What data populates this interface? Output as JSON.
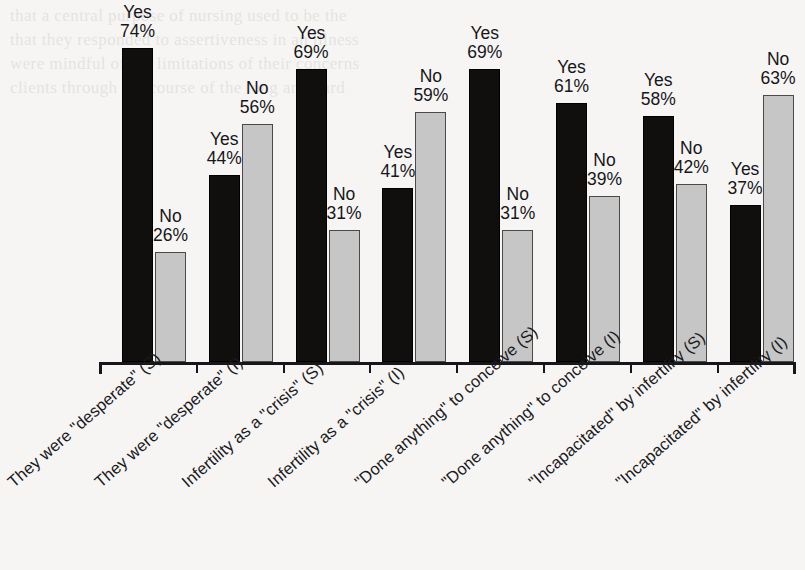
{
  "chart_data": {
    "type": "bar",
    "title": "",
    "subtitle": "",
    "xlabel": "",
    "ylabel": "",
    "ylim": [
      0,
      80
    ],
    "grid": false,
    "legend_position": "none",
    "value_suffix": "%",
    "categories": [
      "They were \"desperate\" (S)",
      "They were \"desperate\" (I)",
      "Infertility as a \"crisis\" (S)",
      "Infertility as a \"crisis\" (I)",
      "\"Done anything\" to conceive (S)",
      "\"Done anything\" to conceive (I)",
      "\"Incapacitated\" by infertility (S)",
      "\"Incapacitated\" by infertility (I)"
    ],
    "series": [
      {
        "name": "Yes",
        "color": "#100f0d",
        "values": [
          74,
          44,
          69,
          41,
          69,
          61,
          58,
          37
        ]
      },
      {
        "name": "No",
        "color": "#c6c6c6",
        "values": [
          26,
          56,
          31,
          59,
          31,
          39,
          42,
          63
        ]
      }
    ],
    "point_labels": [
      {
        "series": "Yes",
        "category_index": 0,
        "name": "Yes",
        "value": "74%"
      },
      {
        "series": "No",
        "category_index": 0,
        "name": "No",
        "value": "26%"
      },
      {
        "series": "Yes",
        "category_index": 1,
        "name": "Yes",
        "value": "44%"
      },
      {
        "series": "No",
        "category_index": 1,
        "name": "No",
        "value": "56%"
      },
      {
        "series": "Yes",
        "category_index": 2,
        "name": "Yes",
        "value": "69%"
      },
      {
        "series": "No",
        "category_index": 2,
        "name": "No",
        "value": "31%"
      },
      {
        "series": "Yes",
        "category_index": 3,
        "name": "Yes",
        "value": "41%"
      },
      {
        "series": "No",
        "category_index": 3,
        "name": "No",
        "value": "59%"
      },
      {
        "series": "Yes",
        "category_index": 4,
        "name": "Yes",
        "value": "69%"
      },
      {
        "series": "No",
        "category_index": 4,
        "name": "No",
        "value": "31%"
      },
      {
        "series": "Yes",
        "category_index": 5,
        "name": "Yes",
        "value": "61%"
      },
      {
        "series": "No",
        "category_index": 5,
        "name": "No",
        "value": "39%"
      },
      {
        "series": "Yes",
        "category_index": 6,
        "name": "Yes",
        "value": "58%"
      },
      {
        "series": "No",
        "category_index": 6,
        "name": "No",
        "value": "42%"
      },
      {
        "series": "Yes",
        "category_index": 7,
        "name": "Yes",
        "value": "37%"
      },
      {
        "series": "No",
        "category_index": 7,
        "name": "No",
        "value": "63%"
      }
    ]
  },
  "page_background": {
    "ghost_text": [
      "that a central purpose of nursing used to be the",
      "that they responded to assertiveness in an illness",
      "were mindful of the limitations of their concerns",
      "clients through the course of the long and hard"
    ]
  }
}
